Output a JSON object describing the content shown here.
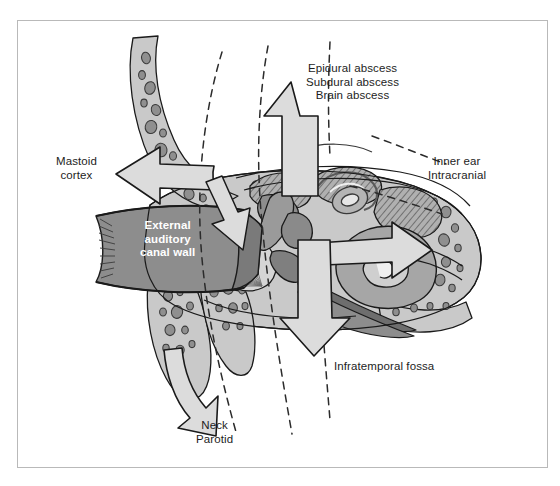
{
  "figure": {
    "border_color": "#b9b9b9",
    "background": "#ffffff"
  },
  "palette": {
    "arrow_fill": "#dcdcdc",
    "arrow_stroke": "#1a1a1a",
    "bone_light": "#c9c9c9",
    "bone_mid": "#a8a8a8",
    "soft_dark": "#8d8d8d",
    "soft_darker": "#6e6e6e",
    "hatch": "#7a7a7a",
    "text": "#1d1d1d",
    "text_on_dark": "#ffffff",
    "dashed_line": "#2b2b2b"
  },
  "labels": {
    "brain": {
      "name": "superior-spread-label",
      "lines": [
        "Epidural abscess",
        "Subdural abscess",
        "Brain abscess"
      ],
      "line1": "Epidural abscess",
      "line2": "Subdural abscess",
      "line3": "Brain abscess"
    },
    "mastoid": {
      "name": "mastoid-cortex-label",
      "line1": "Mastoid",
      "line2": "cortex"
    },
    "inner": {
      "name": "inner-ear-label",
      "line1": "Inner ear",
      "line2": "Intracranial"
    },
    "eac": {
      "name": "external-auditory-canal-wall-label",
      "line1": "External",
      "line2": "auditory",
      "line3": "canal wall"
    },
    "infratemporal": {
      "name": "infratemporal-fossa-label",
      "line1": "Infratemporal fossa"
    },
    "neck": {
      "name": "neck-parotid-label",
      "line1": "Neck",
      "line2": "Parotid"
    }
  },
  "arrows": [
    {
      "id": "arrow-superior",
      "direction": "up",
      "target": "Epidural abscess / Subdural abscess / Brain abscess"
    },
    {
      "id": "arrow-left",
      "direction": "left",
      "target": "Mastoid cortex"
    },
    {
      "id": "arrow-right",
      "direction": "right",
      "target": "Inner ear / Intracranial"
    },
    {
      "id": "arrow-eac",
      "direction": "down-left",
      "target": "External auditory canal wall"
    },
    {
      "id": "arrow-inferior",
      "direction": "down",
      "target": "Infratemporal fossa"
    },
    {
      "id": "arrow-neck",
      "direction": "down-left",
      "target": "Neck / Parotid"
    }
  ],
  "anatomy": [
    {
      "id": "mastoid-air-cells",
      "label": "Mastoid air cells"
    },
    {
      "id": "cochlea",
      "label": "Cochlea"
    },
    {
      "id": "semicircular-canals",
      "label": "Semicircular canals"
    },
    {
      "id": "tympanic-membrane",
      "label": "Tympanic membrane"
    },
    {
      "id": "ossicles",
      "label": "Ossicular chain"
    },
    {
      "id": "eustachian-tube",
      "label": "Eustachian tube"
    },
    {
      "id": "mastoid-tip",
      "label": "Mastoid tip"
    },
    {
      "id": "external-auditory-canal",
      "label": "External auditory canal"
    }
  ]
}
